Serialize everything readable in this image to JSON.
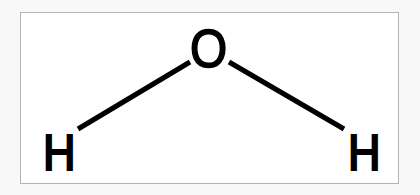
{
  "diagram": {
    "molecule_name": "water",
    "formula": "H2O",
    "geometry": "bent",
    "background_color": "#f8f8f8",
    "panel_color": "#ffffff",
    "border_color": "#b3b3b3",
    "atom_color": "#000000",
    "bond_color": "#000000",
    "atoms": [
      {
        "id": "oxygen",
        "label": "O",
        "element": "O",
        "x": 209,
        "y": 49
      },
      {
        "id": "hydrogen-left",
        "label": "H",
        "element": "H",
        "x": 60,
        "y": 152
      },
      {
        "id": "hydrogen-right",
        "label": "H",
        "element": "H",
        "x": 365,
        "y": 152
      }
    ],
    "bonds": [
      {
        "id": "bond-o-h-left",
        "from": "oxygen",
        "to": "hydrogen-left",
        "x1": 190,
        "y1": 62,
        "x2": 78,
        "y2": 129,
        "order": 1,
        "width": 5
      },
      {
        "id": "bond-o-h-right",
        "from": "oxygen",
        "to": "hydrogen-right",
        "x1": 229,
        "y1": 62,
        "x2": 344,
        "y2": 129,
        "order": 1,
        "width": 5
      }
    ]
  }
}
